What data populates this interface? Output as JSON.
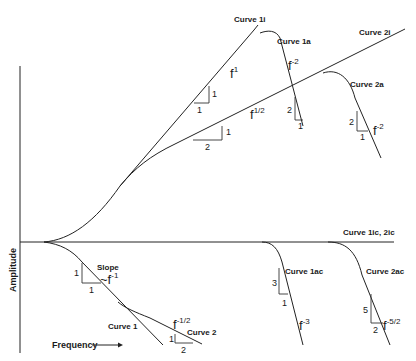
{
  "axes": {
    "y_label": "Amplitude",
    "x_label": "Frequency",
    "x_arrow": "——→"
  },
  "curves": {
    "c1i": "Curve 1i",
    "c1a": "Curve 1a",
    "c2i": "Curve 2i",
    "c2a": "Curve 2a",
    "c1ic2ic": "Curve 1ic, 2ic",
    "c1ac": "Curve 1ac",
    "c2ac": "Curve 2ac",
    "c1": "Curve 1",
    "c2": "Curve 2"
  },
  "slopes": {
    "c1i": {
      "base": "f",
      "exp": "1",
      "rise": "1",
      "run": "1"
    },
    "c1a": {
      "base": "f",
      "exp": "-2",
      "rise": "2",
      "run": "1"
    },
    "c2i": {
      "base": "f",
      "exp": "1/2",
      "rise": "1",
      "run": "2"
    },
    "c2a": {
      "base": "f",
      "exp": "-2",
      "rise": "2",
      "run": "1"
    },
    "c1ac": {
      "base": "f",
      "exp": "-3",
      "rise": "3",
      "run": "1"
    },
    "c2ac": {
      "base": "f",
      "exp": "-5/2",
      "rise": "5",
      "run": "2"
    },
    "c1": {
      "title": "Slope",
      "tilde": "~f",
      "exp": "-1",
      "rise": "1",
      "run": "1"
    },
    "c2": {
      "base": "f",
      "exp": "-1/2",
      "rise": "1",
      "run": "2"
    }
  }
}
